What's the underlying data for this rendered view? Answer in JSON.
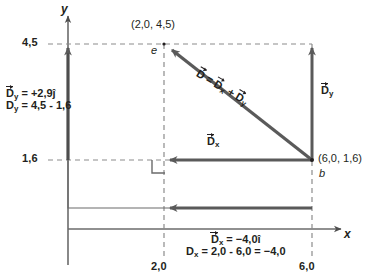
{
  "figure": {
    "type": "vector-component-diagram",
    "axes": {
      "x_label": "x",
      "y_label": "y",
      "y_ticks": [
        "4,5",
        "1,6"
      ],
      "x_ticks": [
        "2,0",
        "6,0"
      ]
    },
    "points": [
      {
        "name": "e",
        "coords": "(2,0, 4,5)"
      },
      {
        "name": "b",
        "coords": "(6,0, 1,6)"
      }
    ],
    "vectors": {
      "resultant_label": "D = Dx + Dy",
      "x_component_label": "Dx",
      "y_component_label": "Dy"
    },
    "annotations": {
      "y_eq_line1_vec": "D",
      "y_eq_line1_sub": "y",
      "y_eq_line1_rest": " = +2,9ĵ",
      "y_eq_line2": "D",
      "y_eq_line2_sub": "y",
      "y_eq_line2_rest": " = 4,5 - 1,6",
      "x_eq_line1_vec": "D",
      "x_eq_line1_sub": "x",
      "x_eq_line1_rest": " = −4,0î",
      "x_eq_line2": "D",
      "x_eq_line2_sub": "x",
      "x_eq_line2_rest": " = 2,0 - 6,0 = −4,0"
    },
    "colors": {
      "ink": "#231f20",
      "vector_gray": "#5a5a5a",
      "axis_gray": "#6b6b6b",
      "dashed_gray": "#8c8c8c",
      "background": "#ffffff"
    }
  }
}
